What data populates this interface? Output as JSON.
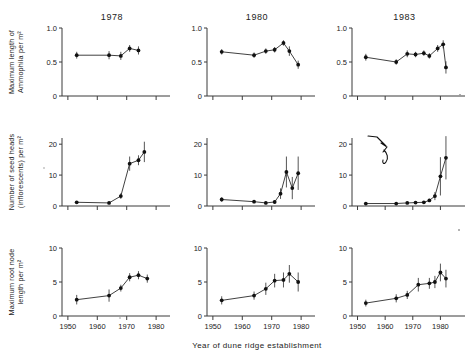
{
  "figure": {
    "xtitle": "Year of dune ridge establishment",
    "column_titles": [
      "1978",
      "1980",
      "1983"
    ],
    "row_ylabels": [
      "Maximum length of Ammophila per m²",
      "Number of seed heads (inflorescents) per m²",
      "Maximum root node length per m²"
    ],
    "xticklabels": [
      "1950",
      "1960",
      "1970",
      "1980"
    ],
    "xtickvalues": [
      1950,
      1960,
      1970,
      1980
    ],
    "yticklabels_row1": [
      "0",
      "0.5",
      "1.0"
    ],
    "yticklabels_row2": [
      "0",
      "10",
      "20"
    ],
    "yticklabels_row3": [
      "0",
      "5",
      "10"
    ],
    "annotation": {
      "name": "handwritten-arrow",
      "panel": "1983 / seed heads",
      "description": "handwritten ink arrow pointing down-right"
    },
    "colors": {
      "axis": "#3b3b3b",
      "line": "#2b2b2b",
      "marker": "#111111",
      "background": "#ffffff"
    }
  },
  "chart_data": [
    {
      "type": "scatter",
      "title": "1978",
      "panel_row": 1,
      "panel_col": 1,
      "xlabel": "Year of dune ridge establishment",
      "ylabel": "Maximum length of Ammophila per m²",
      "xlim": [
        1948,
        1982
      ],
      "ylim": [
        0,
        1.0
      ],
      "yticks": [
        0,
        0.5,
        1.0
      ],
      "xticks": [
        1950,
        1960,
        1970,
        1980
      ],
      "grid": false,
      "x": [
        1953,
        1964,
        1968,
        1971,
        1974
      ],
      "y": [
        0.6,
        0.6,
        0.59,
        0.7,
        0.67
      ],
      "yerr": [
        0.05,
        0.06,
        0.06,
        0.05,
        0.06
      ]
    },
    {
      "type": "scatter",
      "title": "1980",
      "panel_row": 1,
      "panel_col": 2,
      "xlabel": "Year of dune ridge establishment",
      "ylabel": "Maximum length of Ammophila per m²",
      "xlim": [
        1948,
        1982
      ],
      "ylim": [
        0,
        1.0
      ],
      "yticks": [
        0,
        0.5,
        1.0
      ],
      "xticks": [
        1950,
        1960,
        1970,
        1980
      ],
      "grid": false,
      "x": [
        1953,
        1964,
        1968,
        1971,
        1974,
        1976,
        1979
      ],
      "y": [
        0.65,
        0.6,
        0.66,
        0.68,
        0.78,
        0.66,
        0.46
      ],
      "yerr": [
        0.04,
        0.04,
        0.04,
        0.04,
        0.04,
        0.07,
        0.06
      ]
    },
    {
      "type": "scatter",
      "title": "1983",
      "panel_row": 1,
      "panel_col": 3,
      "xlabel": "Year of dune ridge establishment",
      "ylabel": "Maximum length of Ammophila per m²",
      "xlim": [
        1948,
        1986
      ],
      "ylim": [
        0,
        1.0
      ],
      "yticks": [
        0,
        0.5,
        1.0
      ],
      "xticks": [
        1950,
        1960,
        1970,
        1980
      ],
      "grid": false,
      "x": [
        1953,
        1964,
        1968,
        1971,
        1974,
        1976,
        1979,
        1981,
        1982
      ],
      "y": [
        0.57,
        0.5,
        0.62,
        0.61,
        0.63,
        0.59,
        0.7,
        0.76,
        0.42
      ],
      "yerr": [
        0.05,
        0.04,
        0.05,
        0.04,
        0.04,
        0.04,
        0.05,
        0.06,
        0.09
      ]
    },
    {
      "type": "scatter",
      "title": "1978",
      "panel_row": 2,
      "panel_col": 1,
      "xlabel": "Year of dune ridge establishment",
      "ylabel": "Number of seed heads (inflorescents) per m²",
      "xlim": [
        1948,
        1982
      ],
      "ylim": [
        0,
        22
      ],
      "yticks": [
        0,
        10,
        20
      ],
      "xticks": [
        1950,
        1960,
        1970,
        1980
      ],
      "grid": false,
      "x": [
        1953,
        1964,
        1968,
        1971,
        1974,
        1976
      ],
      "y": [
        1.2,
        1.0,
        3.2,
        13.7,
        14.8,
        17.5
      ],
      "yerr": [
        0.4,
        0.4,
        0.9,
        2.3,
        1.6,
        3.3
      ]
    },
    {
      "type": "scatter",
      "title": "1980",
      "panel_row": 2,
      "panel_col": 2,
      "xlabel": "Year of dune ridge establishment",
      "ylabel": "Number of seed heads (inflorescents) per m²",
      "xlim": [
        1948,
        1982
      ],
      "ylim": [
        0,
        22
      ],
      "yticks": [
        0,
        10,
        20
      ],
      "xticks": [
        1950,
        1960,
        1970,
        1980
      ],
      "grid": false,
      "x": [
        1953,
        1964,
        1968,
        1971,
        1973,
        1975,
        1977,
        1979
      ],
      "y": [
        2.1,
        1.4,
        1.0,
        1.3,
        4.0,
        11.0,
        5.8,
        10.6
      ],
      "yerr": [
        0.7,
        0.5,
        0.4,
        0.5,
        1.7,
        5.0,
        3.6,
        5.4
      ]
    },
    {
      "type": "scatter",
      "title": "1983",
      "panel_row": 2,
      "panel_col": 3,
      "xlabel": "Year of dune ridge establishment",
      "ylabel": "Number of seed heads (inflorescents) per m²",
      "xlim": [
        1948,
        1986
      ],
      "ylim": [
        0,
        22
      ],
      "yticks": [
        0,
        10,
        20
      ],
      "xticks": [
        1950,
        1960,
        1970,
        1980
      ],
      "grid": false,
      "x": [
        1953,
        1964,
        1968,
        1971,
        1974,
        1976,
        1978,
        1980,
        1982
      ],
      "y": [
        0.8,
        0.8,
        1.0,
        1.1,
        1.2,
        1.8,
        3.2,
        9.6,
        15.6
      ],
      "yerr": [
        0.3,
        0.3,
        0.3,
        0.3,
        0.4,
        0.5,
        1.3,
        6.2,
        7.0
      ]
    },
    {
      "type": "scatter",
      "title": "1978",
      "panel_row": 3,
      "panel_col": 1,
      "xlabel": "Year of dune ridge establishment",
      "ylabel": "Maximum root node length per m²",
      "xlim": [
        1948,
        1982
      ],
      "ylim": [
        0,
        10
      ],
      "yticks": [
        0,
        5,
        10
      ],
      "xticks": [
        1950,
        1960,
        1970,
        1980
      ],
      "grid": false,
      "x": [
        1953,
        1964,
        1968,
        1971,
        1974,
        1977
      ],
      "y": [
        2.4,
        3.0,
        4.1,
        5.7,
        6.0,
        5.5
      ],
      "yerr": [
        0.7,
        0.9,
        0.5,
        0.6,
        0.6,
        0.6
      ]
    },
    {
      "type": "scatter",
      "title": "1980",
      "panel_row": 3,
      "panel_col": 2,
      "xlabel": "Year of dune ridge establishment",
      "ylabel": "Maximum root node length per m²",
      "xlim": [
        1948,
        1982
      ],
      "ylim": [
        0,
        10
      ],
      "yticks": [
        0,
        5,
        10
      ],
      "xticks": [
        1950,
        1960,
        1970,
        1980
      ],
      "grid": false,
      "x": [
        1953,
        1964,
        1968,
        1971,
        1974,
        1976,
        1979
      ],
      "y": [
        2.3,
        3.0,
        4.0,
        5.2,
        5.3,
        6.2,
        5.0
      ],
      "yerr": [
        0.6,
        0.6,
        0.9,
        1.0,
        1.1,
        1.3,
        1.4
      ]
    },
    {
      "type": "scatter",
      "title": "1983",
      "panel_row": 3,
      "panel_col": 3,
      "xlabel": "Year of dune ridge establishment",
      "ylabel": "Maximum root node length per m²",
      "xlim": [
        1948,
        1986
      ],
      "ylim": [
        0,
        10
      ],
      "yticks": [
        0,
        5,
        10
      ],
      "xticks": [
        1950,
        1960,
        1970,
        1980
      ],
      "grid": false,
      "x": [
        1953,
        1964,
        1968,
        1972,
        1976,
        1978,
        1980,
        1982
      ],
      "y": [
        1.9,
        2.6,
        3.1,
        4.6,
        4.8,
        5.0,
        6.4,
        5.5
      ],
      "yerr": [
        0.5,
        0.6,
        0.6,
        1.0,
        0.8,
        0.9,
        1.3,
        1.3
      ]
    }
  ]
}
